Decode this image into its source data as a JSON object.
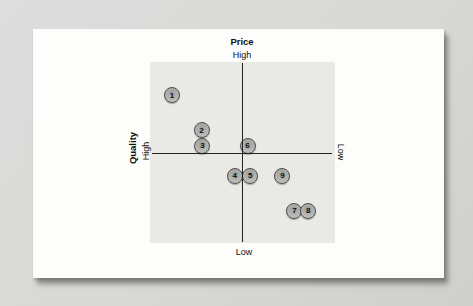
{
  "figure": {
    "description": "Price-quality positioning map with nine numbered competitor markers",
    "colors": {
      "page_bg": "#d8d8d6",
      "card_bg": "#fdfdfb",
      "plot_bg": "#e9e9e6",
      "axis_line": "#22221f",
      "marker_fill": "#b3b3b1",
      "marker_border": "#4b4b49"
    }
  },
  "chart_data": {
    "type": "scatter",
    "title": "",
    "axes": {
      "vertical": {
        "label": "Price",
        "top_label": "High",
        "bottom_label": "Low"
      },
      "horizontal": {
        "label": "Quality",
        "left_label": "High",
        "right_label": "Low"
      }
    },
    "axis_ranges": {
      "quality_high_to_low": [
        1,
        -1
      ],
      "price_low_to_high": [
        -1,
        1
      ]
    },
    "grid": "off",
    "legend": "none",
    "points": [
      {
        "label": "1",
        "quality": 0.76,
        "price": 0.64
      },
      {
        "label": "2",
        "quality": 0.44,
        "price": 0.25
      },
      {
        "label": "3",
        "quality": 0.43,
        "price": 0.08
      },
      {
        "label": "4",
        "quality": 0.08,
        "price": -0.25
      },
      {
        "label": "5",
        "quality": -0.09,
        "price": -0.25
      },
      {
        "label": "6",
        "quality": -0.06,
        "price": 0.08
      },
      {
        "label": "7",
        "quality": -0.57,
        "price": -0.64
      },
      {
        "label": "8",
        "quality": -0.72,
        "price": -0.64
      },
      {
        "label": "9",
        "quality": -0.44,
        "price": -0.25
      }
    ]
  }
}
